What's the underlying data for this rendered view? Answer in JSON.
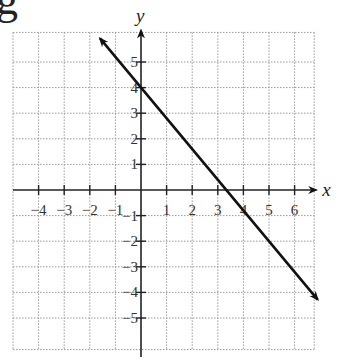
{
  "chart_data": {
    "type": "line",
    "title": "",
    "heading_fragment": "g",
    "xlabel": "x",
    "ylabel": "y",
    "xlim": [
      -5,
      7
    ],
    "ylim": [
      -6,
      6
    ],
    "x_ticks": [
      -4,
      -3,
      -2,
      -1,
      1,
      2,
      3,
      4,
      5,
      6
    ],
    "y_ticks": [
      -5,
      -4,
      -3,
      -2,
      -1,
      1,
      2,
      3,
      4,
      5
    ],
    "x_tick_labels": [
      "−4",
      "−3",
      "−2",
      "−1",
      "1",
      "2",
      "3",
      "4",
      "5",
      "6"
    ],
    "y_tick_labels": [
      "−5",
      "−4",
      "−3",
      "−2",
      "−1",
      "1",
      "2",
      "3",
      "4",
      "5"
    ],
    "grid": true,
    "series": [
      {
        "name": "line",
        "equation": "y = -1.2x + 4",
        "slope": -1.2,
        "intercept": 4,
        "x": [
          -1.6,
          6.9
        ],
        "y": [
          5.92,
          -4.28
        ],
        "arrows": "both"
      }
    ]
  }
}
